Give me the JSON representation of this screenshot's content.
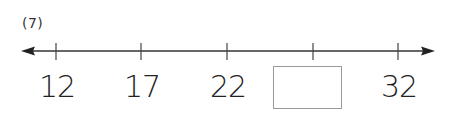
{
  "problem": {
    "number_label": "(7)"
  },
  "number_line": {
    "ticks": [
      {
        "value": "12",
        "x": 56,
        "blank": false
      },
      {
        "value": "17",
        "x": 141,
        "blank": false
      },
      {
        "value": "22",
        "x": 227,
        "blank": false
      },
      {
        "value": "",
        "x": 313,
        "blank": true
      },
      {
        "value": "32",
        "x": 398,
        "blank": false
      }
    ],
    "labels": {
      "t0": "12",
      "t1": "17",
      "t2": "22",
      "t4": "32"
    },
    "answer_box": {
      "value": ""
    },
    "line_color": "#333333",
    "box_border_color": "#9a9a9a"
  }
}
